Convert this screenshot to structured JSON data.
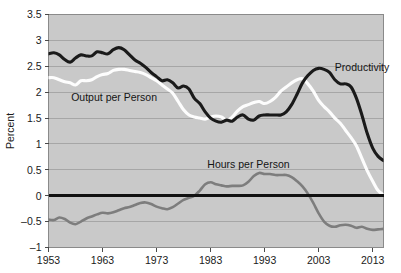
{
  "chart_data": {
    "type": "line",
    "title": "",
    "xlabel": "",
    "ylabel": "Percent",
    "xlim": [
      1953,
      2015
    ],
    "ylim": [
      -1,
      3.5
    ],
    "grid": true,
    "legend_position": "inline-annotations",
    "plot_background": "#c9c9c9",
    "zero_line": 0,
    "ytick_labels": [
      "3.5",
      "3",
      "2.5",
      "2",
      "1.5",
      "1",
      "0.5",
      "0",
      "-0.5",
      "-1"
    ],
    "ytick_values": [
      3.5,
      3,
      2.5,
      2,
      1.5,
      1,
      0.5,
      0,
      -0.5,
      -1
    ],
    "xtick_labels": [
      "1953",
      "1963",
      "1973",
      "1983",
      "1993",
      "2003",
      "2013"
    ],
    "xtick_values": [
      1953,
      1963,
      1973,
      1983,
      1993,
      2003,
      2013
    ],
    "annotations": [
      {
        "text": "Output per Person",
        "x": 1957.2,
        "y": 1.82,
        "color": "#141414"
      },
      {
        "text": "Hours per Person",
        "x": 1982.4,
        "y": 0.53,
        "color": "#141414"
      },
      {
        "text": "Productivity",
        "x": 2006.0,
        "y": 2.4,
        "color": "#141414"
      }
    ],
    "series": [
      {
        "name": "Productivity",
        "color": "#1a1a1a",
        "width": 3.1,
        "x": [
          1953,
          1954,
          1955,
          1956,
          1957,
          1958,
          1959,
          1960,
          1961,
          1962,
          1963,
          1964,
          1965,
          1966,
          1967,
          1968,
          1969,
          1970,
          1971,
          1972,
          1973,
          1974,
          1975,
          1976,
          1977,
          1978,
          1979,
          1980,
          1981,
          1982,
          1983,
          1984,
          1985,
          1986,
          1987,
          1988,
          1989,
          1990,
          1991,
          1992,
          1993,
          1994,
          1995,
          1996,
          1997,
          1998,
          1999,
          2000,
          2001,
          2002,
          2003,
          2004,
          2005,
          2006,
          2007,
          2008,
          2009,
          2010,
          2011,
          2012,
          2013,
          2014,
          2015
        ],
        "y": [
          2.74,
          2.76,
          2.72,
          2.63,
          2.58,
          2.66,
          2.72,
          2.7,
          2.7,
          2.78,
          2.76,
          2.74,
          2.82,
          2.86,
          2.82,
          2.72,
          2.62,
          2.56,
          2.48,
          2.38,
          2.3,
          2.22,
          2.24,
          2.18,
          2.08,
          2.12,
          2.06,
          1.88,
          1.78,
          1.62,
          1.5,
          1.44,
          1.42,
          1.46,
          1.44,
          1.52,
          1.56,
          1.48,
          1.46,
          1.54,
          1.56,
          1.56,
          1.56,
          1.56,
          1.62,
          1.76,
          1.96,
          2.18,
          2.32,
          2.42,
          2.46,
          2.44,
          2.38,
          2.24,
          2.16,
          2.16,
          2.1,
          1.88,
          1.56,
          1.2,
          0.92,
          0.76,
          0.68
        ]
      },
      {
        "name": "Output per Person",
        "color": "#fdfdfd",
        "width": 3.1,
        "x": [
          1953,
          1954,
          1955,
          1956,
          1957,
          1958,
          1959,
          1960,
          1961,
          1962,
          1963,
          1964,
          1965,
          1966,
          1967,
          1968,
          1969,
          1970,
          1971,
          1972,
          1973,
          1974,
          1975,
          1976,
          1977,
          1978,
          1979,
          1980,
          1981,
          1982,
          1983,
          1984,
          1985,
          1986,
          1987,
          1988,
          1989,
          1990,
          1991,
          1992,
          1993,
          1994,
          1995,
          1996,
          1997,
          1998,
          1999,
          2000,
          2001,
          2002,
          2003,
          2004,
          2005,
          2006,
          2007,
          2008,
          2009,
          2010,
          2011,
          2012,
          2013,
          2014,
          2015
        ],
        "y": [
          2.28,
          2.28,
          2.24,
          2.2,
          2.18,
          2.14,
          2.22,
          2.22,
          2.24,
          2.3,
          2.34,
          2.36,
          2.42,
          2.44,
          2.44,
          2.42,
          2.4,
          2.38,
          2.34,
          2.28,
          2.22,
          2.14,
          2.06,
          1.98,
          1.82,
          1.66,
          1.56,
          1.52,
          1.5,
          1.48,
          1.52,
          1.54,
          1.52,
          1.46,
          1.52,
          1.64,
          1.72,
          1.76,
          1.8,
          1.82,
          1.78,
          1.82,
          1.9,
          2.02,
          2.1,
          2.18,
          2.24,
          2.26,
          2.16,
          2.02,
          1.84,
          1.72,
          1.62,
          1.5,
          1.4,
          1.26,
          1.12,
          0.96,
          0.72,
          0.48,
          0.28,
          0.1,
          0.02
        ]
      },
      {
        "name": "Hours per Person",
        "color": "#7d7d7d",
        "width": 2.6,
        "x": [
          1953,
          1954,
          1955,
          1956,
          1957,
          1958,
          1959,
          1960,
          1961,
          1962,
          1963,
          1964,
          1965,
          1966,
          1967,
          1968,
          1969,
          1970,
          1971,
          1972,
          1973,
          1974,
          1975,
          1976,
          1977,
          1978,
          1979,
          1980,
          1981,
          1982,
          1983,
          1984,
          1985,
          1986,
          1987,
          1988,
          1989,
          1990,
          1991,
          1992,
          1993,
          1994,
          1995,
          1996,
          1997,
          1998,
          1999,
          2000,
          2001,
          2002,
          2003,
          2004,
          2005,
          2006,
          2007,
          2008,
          2009,
          2010,
          2011,
          2012,
          2013,
          2014,
          2015
        ],
        "y": [
          -0.46,
          -0.47,
          -0.42,
          -0.45,
          -0.52,
          -0.55,
          -0.5,
          -0.44,
          -0.4,
          -0.36,
          -0.33,
          -0.34,
          -0.32,
          -0.28,
          -0.24,
          -0.22,
          -0.18,
          -0.14,
          -0.13,
          -0.16,
          -0.21,
          -0.24,
          -0.26,
          -0.22,
          -0.15,
          -0.08,
          -0.04,
          0.0,
          0.1,
          0.22,
          0.26,
          0.22,
          0.2,
          0.18,
          0.19,
          0.19,
          0.2,
          0.27,
          0.38,
          0.44,
          0.42,
          0.42,
          0.4,
          0.4,
          0.4,
          0.36,
          0.28,
          0.18,
          0.04,
          -0.14,
          -0.34,
          -0.5,
          -0.58,
          -0.6,
          -0.57,
          -0.56,
          -0.58,
          -0.62,
          -0.6,
          -0.64,
          -0.66,
          -0.65,
          -0.64
        ]
      }
    ]
  }
}
